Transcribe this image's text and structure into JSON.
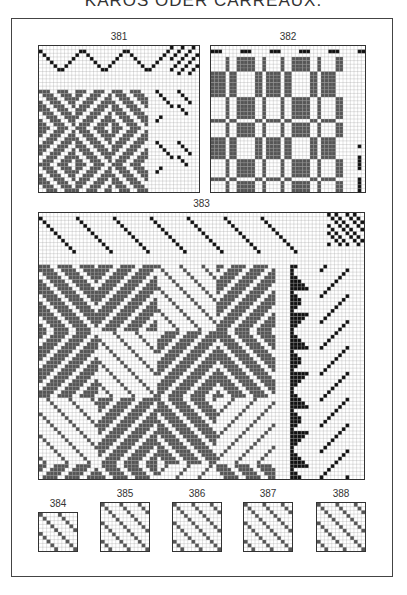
{
  "page": {
    "title": "KARÓS ODER CARREAUX.",
    "colors": {
      "ink": "#111111",
      "fill": "#555555",
      "grid": "#9a9a9a",
      "paper": "#ffffff",
      "frame": "#444444"
    }
  },
  "figures": [
    {
      "id": "381",
      "label": "381",
      "x": 38,
      "y": 45,
      "w": 162,
      "h": 148,
      "cols": 44,
      "rows": 40,
      "kind": "twill-diamond"
    },
    {
      "id": "382",
      "label": "382",
      "x": 210,
      "y": 45,
      "w": 156,
      "h": 148,
      "cols": 42,
      "rows": 40,
      "kind": "check"
    },
    {
      "id": "383",
      "label": "383",
      "x": 38,
      "y": 212,
      "w": 327,
      "h": 268,
      "cols": 88,
      "rows": 72,
      "kind": "twill-blocks"
    },
    {
      "id": "384",
      "label": "384",
      "x": 38,
      "y": 512,
      "w": 40,
      "h": 40,
      "cols": 10,
      "rows": 10,
      "kind": "satin"
    },
    {
      "id": "385",
      "label": "385",
      "x": 100,
      "y": 502,
      "w": 50,
      "h": 50,
      "cols": 13,
      "rows": 13,
      "kind": "satin"
    },
    {
      "id": "386",
      "label": "386",
      "x": 172,
      "y": 502,
      "w": 50,
      "h": 50,
      "cols": 13,
      "rows": 13,
      "kind": "satin"
    },
    {
      "id": "387",
      "label": "387",
      "x": 243,
      "y": 502,
      "w": 50,
      "h": 50,
      "cols": 13,
      "rows": 13,
      "kind": "satin"
    },
    {
      "id": "388",
      "label": "388",
      "x": 316,
      "y": 502,
      "w": 50,
      "h": 50,
      "cols": 13,
      "rows": 13,
      "kind": "satin"
    }
  ]
}
